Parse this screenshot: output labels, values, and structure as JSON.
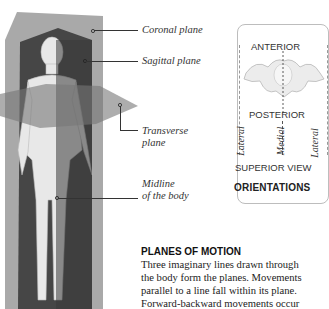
{
  "figure": {
    "labels": {
      "coronal": "Coronal plane",
      "sagittal": "Sagittal plane",
      "transverse_1": "Transverse",
      "transverse_2": "plane",
      "midline_1": "Midline",
      "midline_2": "of the body"
    },
    "colors": {
      "coronal_plane": "#8a8a8a",
      "sagittal_plane": "#3a3a3a",
      "transverse_plane": "#7a7a7a",
      "body": "#e6e6e6"
    }
  },
  "orientations_panel": {
    "anterior": "ANTERIOR",
    "posterior": "POSTERIOR",
    "lateral_left": "Lateral",
    "medial": "Medial",
    "lateral_right": "Lateral",
    "superior_view": "SUPERIOR VIEW",
    "title": "ORIENTATIONS"
  },
  "text_section": {
    "heading": "PLANES OF MOTION",
    "lines": [
      "Three imaginary lines drawn through",
      "the body form the planes. Movements",
      "parallel to a line fall within its plane.",
      "Forward-backward movements occur"
    ]
  }
}
